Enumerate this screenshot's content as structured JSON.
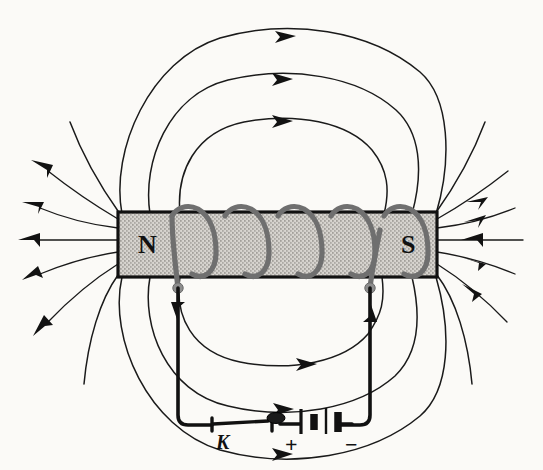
{
  "figure": {
    "kind": "physics-diagram",
    "background_color": "#fbfaf7",
    "ink_color": "#111111"
  },
  "magnet": {
    "north_label": "N",
    "south_label": "S",
    "fill_color": "#d8d6d2",
    "border_color": "#111111",
    "x": 118,
    "y": 212,
    "width": 319,
    "height": 65
  },
  "coil": {
    "color": "#8a8a8a",
    "turns": 5,
    "turn_centers_x": [
      191,
      244,
      297,
      350,
      403
    ]
  },
  "terminals": {
    "left": {
      "x": 178,
      "y": 288,
      "color": "#8d8d8d"
    },
    "right": {
      "x": 370,
      "y": 288,
      "color": "#8d8d8d"
    }
  },
  "circuit": {
    "switch_label": "K",
    "battery_positive_label": "+",
    "battery_negative_label": "−",
    "current_arrow_left": "down",
    "current_arrow_right": "up"
  },
  "field_lines": {
    "stroke_color": "#1a1a1a",
    "top_loops": 3,
    "bottom_loops": 3,
    "left_radial_lines": 6,
    "right_radial_lines": 6,
    "top_arrow_direction": "right",
    "bottom_arrow_direction": "right",
    "north_arrow_direction": "outward",
    "south_arrow_direction": "inward"
  }
}
